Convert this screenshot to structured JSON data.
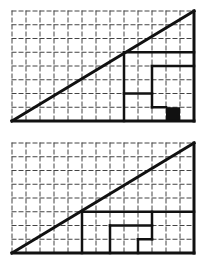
{
  "diagram": {
    "grid": {
      "cols": 13,
      "rows": 8,
      "dash_color": "#444444",
      "line_color": "#111111",
      "background": "#ffffff"
    },
    "figures": [
      {
        "id": "top",
        "diagonal": [
          [
            0,
            0
          ],
          [
            13,
            8
          ]
        ],
        "segments": [
          [
            [
              8,
              0
            ],
            [
              8,
              5
            ]
          ],
          [
            [
              8,
              5
            ],
            [
              13,
              5
            ]
          ],
          [
            [
              10,
              1
            ],
            [
              10,
              4
            ]
          ],
          [
            [
              10,
              4
            ],
            [
              13,
              4
            ]
          ],
          [
            [
              8,
              2
            ],
            [
              10,
              2
            ]
          ],
          [
            [
              10,
              1
            ],
            [
              11,
              1
            ]
          ]
        ],
        "filled_cells": [
          [
            11,
            0
          ]
        ]
      },
      {
        "id": "bottom",
        "diagonal": [
          [
            0,
            0
          ],
          [
            13,
            8
          ]
        ],
        "segments": [
          [
            [
              5,
              0
            ],
            [
              5,
              3
            ]
          ],
          [
            [
              5,
              3
            ],
            [
              13,
              3
            ]
          ],
          [
            [
              7,
              0
            ],
            [
              7,
              2
            ]
          ],
          [
            [
              7,
              2
            ],
            [
              10,
              2
            ]
          ],
          [
            [
              10,
              1
            ],
            [
              10,
              3
            ]
          ],
          [
            [
              9,
              1
            ],
            [
              10,
              1
            ]
          ],
          [
            [
              9,
              0
            ],
            [
              9,
              1
            ]
          ]
        ],
        "filled_cells": []
      }
    ]
  }
}
